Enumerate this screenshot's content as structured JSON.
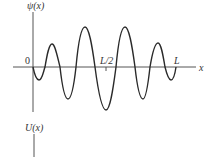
{
  "diagram": {
    "labels": {
      "psi_axis": "ψ(x)",
      "u_axis": "U(x)",
      "x_axis": "x",
      "origin": "0",
      "half_length": "L/2",
      "length": "L"
    },
    "colors": {
      "axis": "#555555",
      "curve": "#2a2a2a",
      "background": "#ffffff"
    }
  }
}
